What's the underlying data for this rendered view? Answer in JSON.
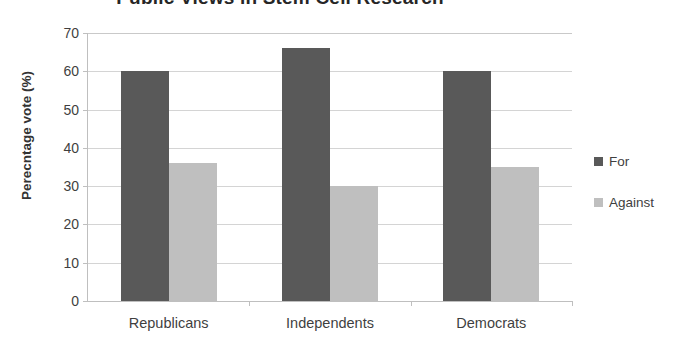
{
  "chart_data": {
    "type": "bar",
    "title": "Public Views in Stem Cell Research",
    "xlabel": "",
    "ylabel": "Perecntage vote (%)",
    "categories": [
      "Republicans",
      "Independents",
      "Democrats"
    ],
    "series": [
      {
        "name": "For",
        "color": "#595959",
        "values": [
          60,
          66,
          60
        ]
      },
      {
        "name": "Against",
        "color": "#bfbfbf",
        "values": [
          36,
          30,
          35
        ]
      }
    ],
    "ylim": [
      0,
      70
    ],
    "ytick_step": 10,
    "yticks": [
      0,
      10,
      20,
      30,
      40,
      50,
      60,
      70
    ],
    "ytick_labels": [
      "0",
      "10",
      "20",
      "30",
      "40",
      "50",
      "60",
      "70"
    ],
    "grid": true,
    "grid_axis": "y",
    "legend_position": "right",
    "legend_entries": [
      "For",
      "Against"
    ],
    "background_color": "#ffffff",
    "text_color": "#3f3f3f"
  }
}
